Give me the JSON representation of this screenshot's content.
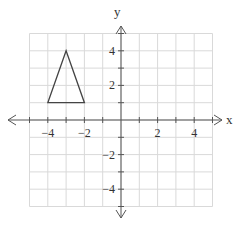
{
  "chart_data": {
    "type": "scatter",
    "title": "",
    "xlabel": "x",
    "ylabel": "y",
    "xlim": [
      -5,
      5
    ],
    "ylim": [
      -5,
      5
    ],
    "grid": true,
    "x_ticks": [
      -4,
      -2,
      2,
      4
    ],
    "y_ticks": [
      4,
      2,
      -2,
      -4
    ],
    "x_tick_labels": [
      "-4",
      "-2",
      "2",
      "4"
    ],
    "y_tick_labels": [
      "4",
      "2",
      "−2",
      "−4"
    ],
    "shapes": [
      {
        "name": "triangle",
        "vertices": [
          [
            -4,
            1
          ],
          [
            -3,
            4
          ],
          [
            -2,
            1
          ]
        ],
        "closed": true
      }
    ]
  },
  "colors": {
    "grid": "#d9d9d9",
    "axis": "#555555",
    "shape": "#444444"
  }
}
